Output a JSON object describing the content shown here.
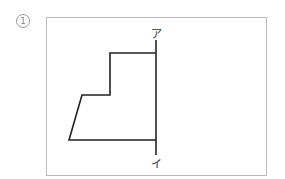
{
  "problem": {
    "number": "1",
    "axis_top_label": "ア",
    "axis_bottom_label": "イ"
  },
  "figure": {
    "frame": {
      "x": 46,
      "y": 17,
      "width": 220,
      "height": 158,
      "color": "#bbbbbb"
    },
    "axis": {
      "x": 156,
      "y1": 40,
      "y2": 155,
      "color": "#222222"
    },
    "shape_points": "156,53 110,53 110,95 82,95 69,140 156,140",
    "stroke": "#222222"
  }
}
